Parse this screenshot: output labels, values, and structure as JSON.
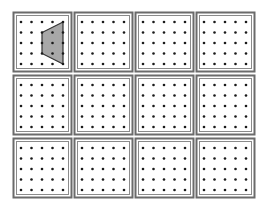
{
  "figure": {
    "rows": 3,
    "cols": 4,
    "dots_per_side": 5,
    "colors": {
      "frame_outer": "#6b6b6b",
      "frame_inner": "#8a8a8a",
      "dot": "#1a1a1a",
      "shape_fill": "#a8a8a8",
      "shape_stroke": "#333333"
    },
    "boards": [
      {
        "row": 0,
        "col": 0,
        "shape": "trapezoid"
      },
      {
        "row": 0,
        "col": 1,
        "shape": null
      },
      {
        "row": 0,
        "col": 2,
        "shape": null
      },
      {
        "row": 0,
        "col": 3,
        "shape": null
      },
      {
        "row": 1,
        "col": 0,
        "shape": null
      },
      {
        "row": 1,
        "col": 1,
        "shape": null
      },
      {
        "row": 1,
        "col": 2,
        "shape": null
      },
      {
        "row": 1,
        "col": 3,
        "shape": null
      },
      {
        "row": 2,
        "col": 0,
        "shape": null
      },
      {
        "row": 2,
        "col": 1,
        "shape": null
      },
      {
        "row": 2,
        "col": 2,
        "shape": null
      },
      {
        "row": 2,
        "col": 3,
        "shape": null
      }
    ],
    "trapezoid_vertices_grid": [
      [
        4,
        0
      ],
      [
        2,
        1
      ],
      [
        2,
        3
      ],
      [
        4,
        4
      ]
    ]
  }
}
